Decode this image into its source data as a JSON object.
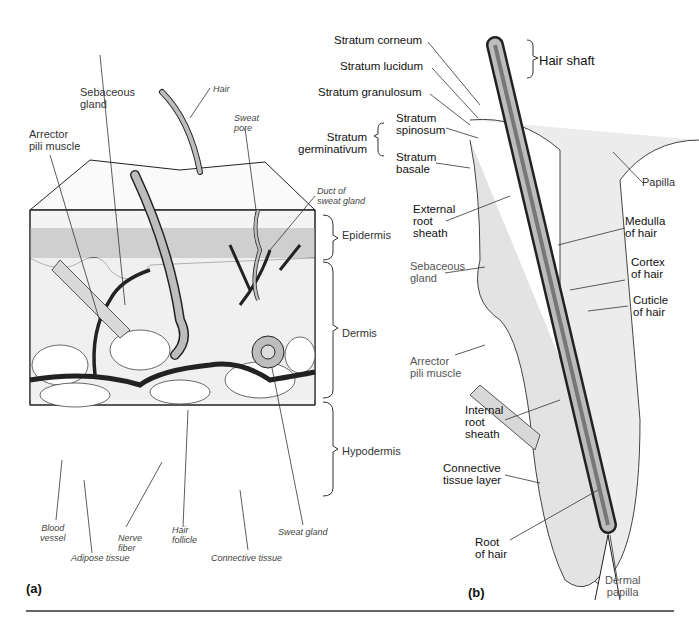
{
  "panel_a": {
    "label": "(a)",
    "labels": {
      "hair": "Hair",
      "sebaceous_gland": "Sebaceous\ngland",
      "arrector_pili": "Arrector\npili muscle",
      "sweat_pore": "Sweat\npore",
      "duct_sweat_gland": "Duct of\nsweat gland",
      "epidermis": "Epidermis",
      "dermis": "Dermis",
      "hypodermis": "Hypodermis",
      "blood_vessel": "Blood\nvessel",
      "adipose_tissue": "Adipose tissue",
      "nerve_fiber": "Nerve\nfiber",
      "hair_follicle": "Hair\nfollicle",
      "connective_tissue": "Connective tissue",
      "sweat_gland": "Sweat gland"
    }
  },
  "panel_b": {
    "label": "(b)",
    "labels": {
      "stratum_corneum": "Stratum corneum",
      "stratum_lucidum": "Stratum lucidum",
      "stratum_granulosum": "Stratum granulosum",
      "stratum_germinativum": "Stratum\ngerminativum",
      "stratum_spinosum": "Stratum\nspinosum",
      "stratum_basale": "Stratum\nbasale",
      "hair_shaft": "Hair shaft",
      "papilla": "Papilla",
      "external_root_sheath": "External\nroot\nsheath",
      "medulla": "Medulla\nof hair",
      "sebaceous_gland": "Sebaceous\ngland",
      "cortex": "Cortex\nof hair",
      "cuticle": "Cuticle\nof hair",
      "arrector_pili": "Arrector\npili muscle",
      "internal_root_sheath": "Internal\nroot\nsheath",
      "connective_tissue_layer": "Connective\ntissue layer",
      "root_of_hair": "Root\nof hair",
      "dermal_papilla": "Dermal\npapilla"
    }
  },
  "colors": {
    "ink": "#222222",
    "hair_fill": "#bdbdbd",
    "rule": "#666666"
  }
}
